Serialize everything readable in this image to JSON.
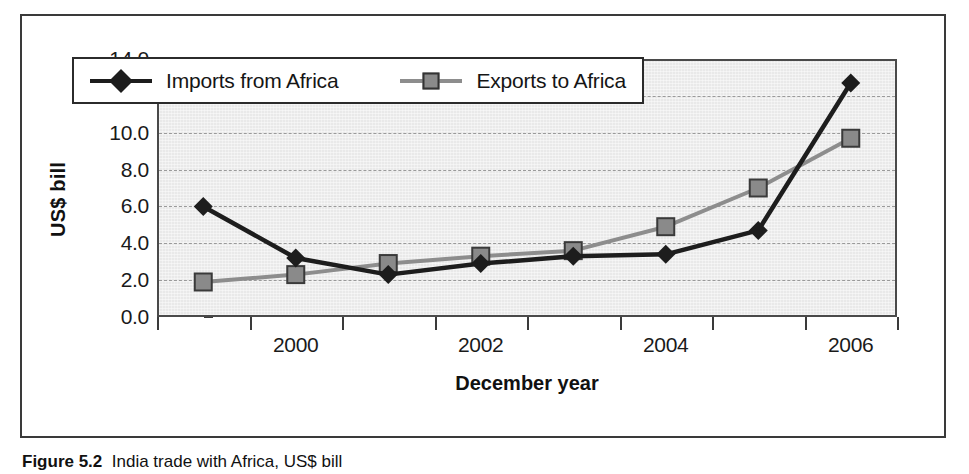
{
  "figure": {
    "caption_label": "Figure 5.2",
    "caption_text": "India trade with Africa, US$ bill"
  },
  "chart_data": {
    "type": "line",
    "title": "",
    "xlabel": "December year",
    "ylabel": "US$ bill",
    "ylim": [
      0.0,
      14.0
    ],
    "ytick_step": 2.0,
    "grid": true,
    "legend_position": "top-left-inside",
    "categories": [
      1999,
      2000,
      2001,
      2002,
      2003,
      2004,
      2005,
      2006
    ],
    "xtick_labels": [
      "",
      "2000",
      "",
      "2002",
      "",
      "2004",
      "",
      "2006"
    ],
    "ytick_labels": [
      "0.0",
      "2.0",
      "4.0",
      "6.0",
      "8.0",
      "10.0",
      "12.0",
      "14.0"
    ],
    "series": [
      {
        "name": "Imports from Africa",
        "marker": "diamond",
        "color": "#1d1d1d",
        "values": [
          6.0,
          3.2,
          2.3,
          2.9,
          3.3,
          3.4,
          4.7,
          12.7
        ]
      },
      {
        "name": "Exports to Africa",
        "marker": "square",
        "color": "#8d8d8d",
        "values": [
          1.9,
          2.3,
          2.9,
          3.3,
          3.6,
          4.9,
          7.0,
          9.7
        ]
      }
    ]
  },
  "colors": {
    "plot_background": "#e9e9e9",
    "gridline": "#9a9a9a",
    "axis": "#3a3a3a",
    "imports_line": "#1d1d1d",
    "exports_line": "#8d8d8d",
    "exports_marker_fill": "#8a8a8a"
  }
}
